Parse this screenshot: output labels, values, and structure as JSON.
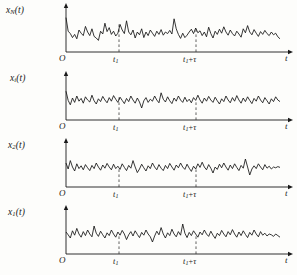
{
  "figure": {
    "name": "random-process-ensemble",
    "background_color": "#fdfdfb",
    "ink_color": "#141414",
    "dash_color": "#3a3a3a",
    "width": 297,
    "height": 275,
    "panel_count": 4
  },
  "axis": {
    "origin_label": "O",
    "time_axis_label": "t",
    "tick_t1": "t",
    "tick_t1_sub": "1",
    "tick_t1_tau_lead": "t",
    "tick_t1_tau_sub": "1",
    "tick_t1_tau_plus": "+",
    "tick_t1_tau_sym": "τ",
    "tick_positions_px": [
      119,
      196
    ],
    "axis_start_px": 66,
    "axis_end_px": 288
  },
  "panels": [
    {
      "id": "panel-xN",
      "y_label_var": "x",
      "y_label_sub": "N",
      "y_label_arg": "(t)",
      "top_px": 2
    },
    {
      "id": "panel-xi",
      "y_label_var": "x",
      "y_label_sub": "i",
      "y_label_arg": "(t)",
      "top_px": 70
    },
    {
      "id": "panel-x2",
      "y_label_var": "x",
      "y_label_sub": "2",
      "y_label_arg": "(t)",
      "top_px": 137
    },
    {
      "id": "panel-x1",
      "y_label_var": "x",
      "y_label_sub": "1",
      "y_label_arg": "(t)",
      "top_px": 204
    }
  ],
  "chart_data": {
    "type": "line",
    "title": "",
    "xlabel": "t",
    "ylabel": "",
    "grid": false,
    "legend": "none",
    "x_annotations": [
      "t1",
      "t1+τ"
    ],
    "xlim": [
      0,
      100
    ],
    "ylim": [
      0,
      1
    ],
    "series": [
      {
        "name": "xN(t)",
        "values": [
          0.86,
          0.52,
          0.46,
          0.36,
          0.44,
          0.33,
          0.55,
          0.47,
          0.41,
          0.64,
          0.5,
          0.41,
          0.58,
          0.39,
          0.35,
          0.29,
          0.52,
          0.45,
          0.72,
          0.51,
          0.61,
          0.44,
          0.52,
          0.4,
          0.47,
          0.69,
          0.55,
          0.46,
          0.78,
          0.5,
          0.43,
          0.55,
          0.35,
          0.5,
          0.43,
          0.58,
          0.36,
          0.5,
          0.41,
          0.55,
          0.47,
          0.39,
          0.52,
          0.44,
          0.56,
          0.42,
          0.5,
          0.46,
          0.54,
          0.45,
          0.83,
          0.58,
          0.44,
          0.34,
          0.47,
          0.36,
          0.42,
          0.5,
          0.57,
          0.46,
          0.6,
          0.48,
          0.53,
          0.41,
          0.5,
          0.38,
          0.62,
          0.46,
          0.35,
          0.52,
          0.44,
          0.57,
          0.47,
          0.63,
          0.5,
          0.42,
          0.55,
          0.46,
          0.4,
          0.52,
          0.45,
          0.37,
          0.58,
          0.48,
          0.66,
          0.5,
          0.43,
          0.56,
          0.47,
          0.39,
          0.51,
          0.44,
          0.54,
          0.46,
          0.41,
          0.5,
          0.43,
          0.47,
          0.38,
          0.33
        ]
      },
      {
        "name": "xi(t)",
        "values": [
          0.72,
          0.49,
          0.38,
          0.55,
          0.44,
          0.6,
          0.47,
          0.54,
          0.42,
          0.58,
          0.5,
          0.45,
          0.62,
          0.48,
          0.4,
          0.53,
          0.46,
          0.59,
          0.5,
          0.43,
          0.56,
          0.47,
          0.61,
          0.52,
          0.44,
          0.57,
          0.49,
          0.41,
          0.54,
          0.46,
          0.6,
          0.5,
          0.42,
          0.55,
          0.45,
          0.3,
          0.48,
          0.56,
          0.44,
          0.52,
          0.47,
          0.6,
          0.5,
          0.43,
          0.68,
          0.52,
          0.45,
          0.58,
          0.48,
          0.41,
          0.55,
          0.47,
          0.6,
          0.5,
          0.44,
          0.57,
          0.46,
          0.52,
          0.43,
          0.56,
          0.49,
          0.62,
          0.5,
          0.42,
          0.55,
          0.47,
          0.59,
          0.5,
          0.44,
          0.57,
          0.48,
          0.4,
          0.53,
          0.46,
          0.6,
          0.5,
          0.43,
          0.56,
          0.47,
          0.61,
          0.5,
          0.42,
          0.55,
          0.46,
          0.58,
          0.49,
          0.41,
          0.54,
          0.47,
          0.6,
          0.5,
          0.43,
          0.56,
          0.48,
          0.4,
          0.53,
          0.46,
          0.58,
          0.5,
          0.46
        ]
      },
      {
        "name": "x2(t)",
        "values": [
          0.6,
          0.45,
          0.66,
          0.5,
          0.4,
          0.58,
          0.46,
          0.53,
          0.43,
          0.56,
          0.48,
          0.41,
          0.54,
          0.46,
          0.6,
          0.5,
          0.42,
          0.55,
          0.47,
          0.59,
          0.5,
          0.43,
          0.57,
          0.46,
          0.52,
          0.44,
          0.58,
          0.49,
          0.41,
          0.54,
          0.47,
          0.66,
          0.5,
          0.36,
          0.45,
          0.57,
          0.48,
          0.4,
          0.53,
          0.46,
          0.6,
          0.5,
          0.43,
          0.56,
          0.47,
          0.41,
          0.54,
          0.46,
          0.59,
          0.5,
          0.42,
          0.55,
          0.48,
          0.6,
          0.5,
          0.44,
          0.57,
          0.47,
          0.39,
          0.52,
          0.45,
          0.58,
          0.49,
          0.62,
          0.5,
          0.43,
          0.56,
          0.47,
          0.35,
          0.5,
          0.44,
          0.57,
          0.48,
          0.6,
          0.5,
          0.42,
          0.55,
          0.46,
          0.58,
          0.49,
          0.41,
          0.54,
          0.47,
          0.7,
          0.5,
          0.3,
          0.45,
          0.53,
          0.46,
          0.58,
          0.5,
          0.43,
          0.56,
          0.47,
          0.52,
          0.45,
          0.5,
          0.48,
          0.51,
          0.49
        ]
      },
      {
        "name": "x1(t)",
        "values": [
          0.55,
          0.48,
          0.4,
          0.58,
          0.47,
          0.64,
          0.5,
          0.42,
          0.56,
          0.46,
          0.6,
          0.5,
          0.43,
          0.7,
          0.52,
          0.44,
          0.57,
          0.48,
          0.4,
          0.53,
          0.46,
          0.6,
          0.5,
          0.42,
          0.55,
          0.47,
          0.59,
          0.5,
          0.36,
          0.48,
          0.56,
          0.45,
          0.58,
          0.49,
          0.41,
          0.54,
          0.47,
          0.6,
          0.5,
          0.43,
          0.3,
          0.45,
          0.57,
          0.48,
          0.66,
          0.5,
          0.4,
          0.53,
          0.46,
          0.62,
          0.5,
          0.43,
          0.56,
          0.47,
          0.75,
          0.52,
          0.41,
          0.54,
          0.46,
          0.58,
          0.5,
          0.42,
          0.55,
          0.48,
          0.6,
          0.5,
          0.44,
          0.57,
          0.47,
          0.39,
          0.52,
          0.46,
          0.59,
          0.5,
          0.43,
          0.56,
          0.48,
          0.61,
          0.5,
          0.42,
          0.55,
          0.46,
          0.58,
          0.49,
          0.41,
          0.54,
          0.47,
          0.6,
          0.5,
          0.43,
          0.56,
          0.47,
          0.52,
          0.45,
          0.5,
          0.48,
          0.44,
          0.5,
          0.46,
          0.42
        ]
      }
    ]
  }
}
